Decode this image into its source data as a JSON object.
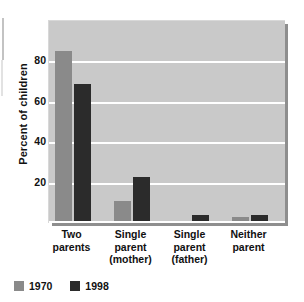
{
  "chart_data": {
    "type": "bar",
    "title": "",
    "subtitle": "",
    "xlabel": "",
    "ylabel": "Percent of children",
    "ylim": [
      0,
      100
    ],
    "yticks": [
      20,
      40,
      60,
      80
    ],
    "ytick_labels": [
      "20",
      "40",
      "60",
      "80"
    ],
    "grid": true,
    "legend_position": "bottom-left",
    "categories": [
      "Two parents",
      "Single parent (mother)",
      "Single parent (father)",
      "Neither parent"
    ],
    "category_lines": [
      [
        "Two",
        "parents"
      ],
      [
        "Single",
        "parent",
        "(mother)"
      ],
      [
        "Single",
        "parent",
        "(father)"
      ],
      [
        "Neither",
        "parent"
      ]
    ],
    "series": [
      {
        "name": "1970",
        "color": "#8a8a8a",
        "values": [
          85,
          11,
          1,
          3
        ]
      },
      {
        "name": "1998",
        "color": "#2b2b2b",
        "values": [
          69,
          23,
          4,
          4
        ]
      }
    ]
  },
  "legend": {
    "items": [
      {
        "label": "1970",
        "color": "#8a8a8a"
      },
      {
        "label": "1998",
        "color": "#2b2b2b"
      }
    ]
  },
  "axis": {
    "y_title": "Percent of children",
    "ticks": [
      "80",
      "60",
      "40",
      "20"
    ]
  },
  "colors": {
    "plot_background": "#c9c9c9",
    "gridline": "#ffffff",
    "panel_shadow": "#8e8e8e",
    "series_1970": "#8a8a8a",
    "series_1998": "#2b2b2b",
    "text": "#111111"
  }
}
